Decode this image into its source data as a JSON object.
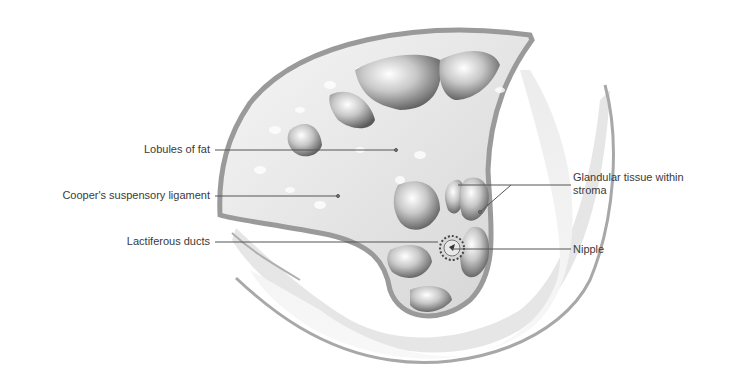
{
  "diagram": {
    "labels_left": [
      {
        "id": "lobules-of-fat",
        "text": "Lobules of fat"
      },
      {
        "id": "coopers-ligament",
        "text": "Cooper's suspensory ligament"
      },
      {
        "id": "lactiferous-ducts",
        "text": "Lactiferous ducts"
      }
    ],
    "labels_right": [
      {
        "id": "glandular-tissue",
        "text": "Glandular tissue within",
        "text2": "stroma"
      },
      {
        "id": "nipple",
        "text": "Nipple"
      }
    ],
    "colors": {
      "tissue_light": "#e8e8e8",
      "tissue_mid": "#c9c9c9",
      "tissue_dark": "#7a7a7a",
      "outline": "#9a9a9a",
      "leader_line": "#555555",
      "text": "#3a3a3a"
    }
  }
}
